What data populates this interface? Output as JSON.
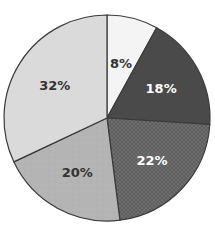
{
  "chart_data": {
    "type": "pie",
    "title": "",
    "start_angle_deg": 0,
    "direction": "clockwise",
    "slices": [
      {
        "label": "8%",
        "value": 8,
        "fill": "#f4f4f4",
        "text_color": "#333333",
        "pattern": "solid"
      },
      {
        "label": "18%",
        "value": 18,
        "fill": "#4a4a4a",
        "text_color": "#ffffff",
        "pattern": "solid"
      },
      {
        "label": "22%",
        "value": 22,
        "fill": "#6e6e6e",
        "text_color": "#ffffff",
        "pattern": "crosshatch"
      },
      {
        "label": "20%",
        "value": 20,
        "fill": "#b4b4b4",
        "text_color": "#333333",
        "pattern": "speckle"
      },
      {
        "label": "32%",
        "value": 32,
        "fill": "#dadada",
        "text_color": "#333333",
        "pattern": "solid"
      }
    ],
    "legend": null,
    "outline_color": "#3a3a3a"
  }
}
